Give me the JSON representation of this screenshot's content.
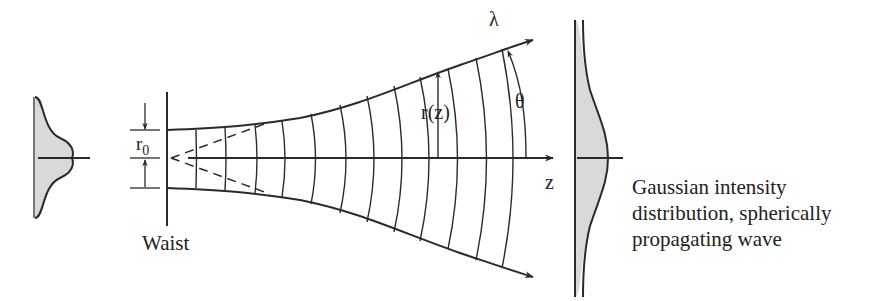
{
  "labels": {
    "wavelength": "λ",
    "radius": "r(z)",
    "divergence_angle": "θ",
    "axis": "z",
    "waist_radius_main": "r",
    "waist_radius_sub": "0",
    "waist": "Waist"
  },
  "caption": {
    "lines": [
      "Gaussian intensity",
      "distribution, spherically",
      "propagating wave"
    ]
  },
  "colors": {
    "line": "#2a2a2a",
    "fill": "#d9d9d9",
    "background": "#ffffff"
  }
}
